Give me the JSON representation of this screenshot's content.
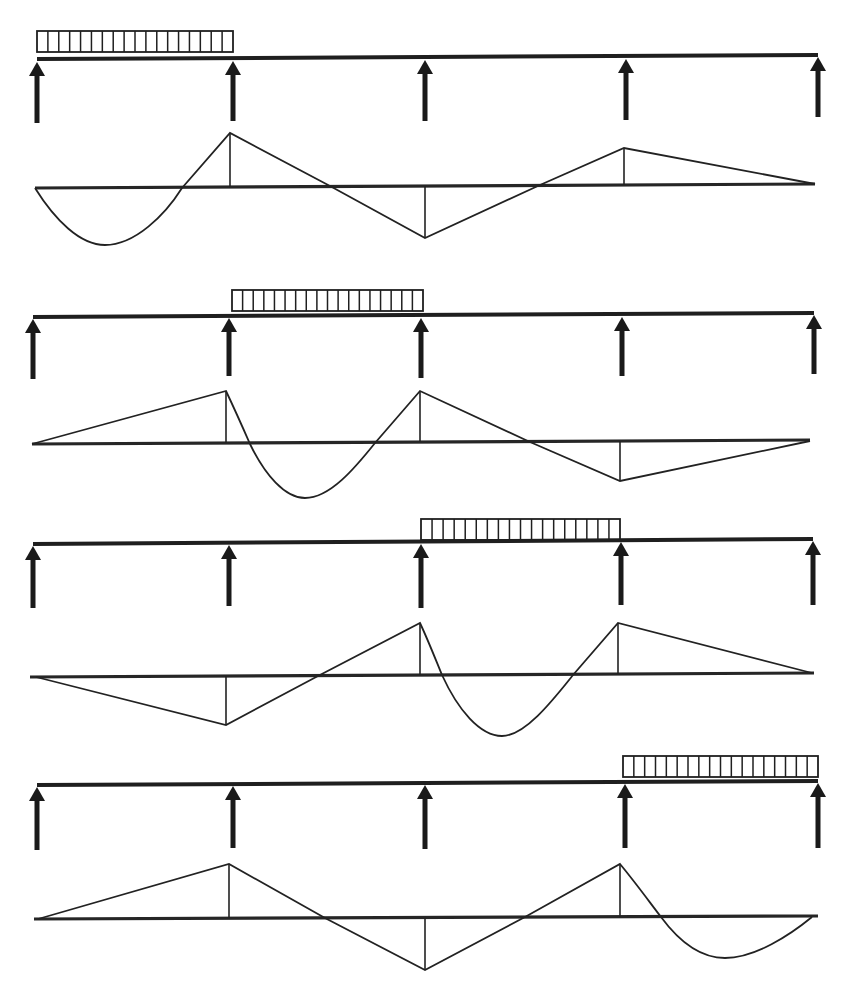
{
  "title": "",
  "colors": {
    "ink": "#1f1f1f",
    "background": "#ffffff"
  },
  "figure": {
    "spans": 4,
    "supports_per_case": 5,
    "cases": [
      {
        "id": "case-1",
        "loaded_span": 1,
        "beam": {
          "x1": 37,
          "x2": 818,
          "y1": 59,
          "y2": 55
        },
        "load": {
          "x1": 37,
          "x2": 233,
          "y_top": 31,
          "y_bottom": 52,
          "cells": 18
        },
        "supports": [
          {
            "x": 37,
            "y_top": 62,
            "y_bottom": 123
          },
          {
            "x": 233,
            "y_top": 61,
            "y_bottom": 121
          },
          {
            "x": 425,
            "y_top": 60,
            "y_bottom": 121
          },
          {
            "x": 626,
            "y_top": 59,
            "y_bottom": 120
          },
          {
            "x": 818,
            "y_top": 57,
            "y_bottom": 117
          }
        ],
        "moment_diagram": {
          "baseline": {
            "x1": 35,
            "x2": 815,
            "y1": 188,
            "y2": 184
          },
          "path": "M35,188 C55,220 80,245 105,245 C135,245 165,215 182,188 L230,133 L330,186 L425,238 L540,185 L624,148 L815,184",
          "ordinates": [
            {
              "x": 230,
              "y1": 133,
              "y2": 187
            },
            {
              "x": 425,
              "y1": 186,
              "y2": 238
            },
            {
              "x": 624,
              "y1": 148,
              "y2": 185
            }
          ]
        }
      },
      {
        "id": "case-2",
        "loaded_span": 2,
        "beam": {
          "x1": 33,
          "x2": 814,
          "y1": 317,
          "y2": 313
        },
        "load": {
          "x1": 232,
          "x2": 423,
          "y_top": 290,
          "y_bottom": 311,
          "cells": 18
        },
        "supports": [
          {
            "x": 33,
            "y_top": 319,
            "y_bottom": 379
          },
          {
            "x": 229,
            "y_top": 318,
            "y_bottom": 376
          },
          {
            "x": 421,
            "y_top": 318,
            "y_bottom": 378
          },
          {
            "x": 622,
            "y_top": 317,
            "y_bottom": 376
          },
          {
            "x": 814,
            "y_top": 315,
            "y_bottom": 374
          }
        ],
        "moment_diagram": {
          "baseline": {
            "x1": 32,
            "x2": 810,
            "y1": 444,
            "y2": 440
          },
          "path": "M32,444 L226,391 C235,410 243,428 250,444 C265,475 285,498 305,498 C330,498 355,468 375,443 L420,391 L530,442 L620,481 L810,441",
          "ordinates": [
            {
              "x": 226,
              "y1": 391,
              "y2": 443
            },
            {
              "x": 420,
              "y1": 391,
              "y2": 442
            },
            {
              "x": 620,
              "y1": 441,
              "y2": 481
            }
          ]
        }
      },
      {
        "id": "case-3",
        "loaded_span": 3,
        "beam": {
          "x1": 33,
          "x2": 813,
          "y1": 544,
          "y2": 539
        },
        "load": {
          "x1": 421,
          "x2": 620,
          "y_top": 519,
          "y_bottom": 540,
          "cells": 18
        },
        "supports": [
          {
            "x": 33,
            "y_top": 546,
            "y_bottom": 608
          },
          {
            "x": 229,
            "y_top": 545,
            "y_bottom": 606
          },
          {
            "x": 421,
            "y_top": 544,
            "y_bottom": 608
          },
          {
            "x": 621,
            "y_top": 542,
            "y_bottom": 605
          },
          {
            "x": 813,
            "y_top": 541,
            "y_bottom": 605
          }
        ],
        "moment_diagram": {
          "baseline": {
            "x1": 30,
            "x2": 814,
            "y1": 677,
            "y2": 673
          },
          "path": "M36,677 L226,725 L318,676 L420,623 C428,640 435,658 442,675 C458,710 480,736 502,736 C525,736 553,700 573,675 L618,623 L812,673",
          "ordinates": [
            {
              "x": 226,
              "y1": 676,
              "y2": 725
            },
            {
              "x": 420,
              "y1": 623,
              "y2": 675
            },
            {
              "x": 618,
              "y1": 623,
              "y2": 674
            }
          ]
        }
      },
      {
        "id": "case-4",
        "loaded_span": 4,
        "beam": {
          "x1": 37,
          "x2": 818,
          "y1": 785,
          "y2": 781
        },
        "load": {
          "x1": 623,
          "x2": 818,
          "y_top": 756,
          "y_bottom": 777,
          "cells": 18
        },
        "supports": [
          {
            "x": 37,
            "y_top": 787,
            "y_bottom": 850
          },
          {
            "x": 233,
            "y_top": 786,
            "y_bottom": 848
          },
          {
            "x": 425,
            "y_top": 785,
            "y_bottom": 849
          },
          {
            "x": 625,
            "y_top": 784,
            "y_bottom": 848
          },
          {
            "x": 818,
            "y_top": 783,
            "y_bottom": 848
          }
        ],
        "moment_diagram": {
          "baseline": {
            "x1": 34,
            "x2": 818,
            "y1": 919,
            "y2": 916
          },
          "path": "M38,919 L229,864 L325,918 L425,970 L525,917 L620,864 C635,882 648,900 661,917 C678,940 700,958 725,958 C755,958 790,935 812,917",
          "ordinates": [
            {
              "x": 229,
              "y1": 864,
              "y2": 918
            },
            {
              "x": 425,
              "y1": 918,
              "y2": 970
            },
            {
              "x": 620,
              "y1": 864,
              "y2": 917
            }
          ]
        }
      }
    ]
  }
}
